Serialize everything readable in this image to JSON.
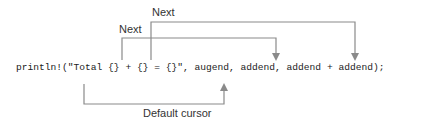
{
  "code_line": "println!(\"Total {} + {} = {}\", augend, addend, addend + addend);",
  "labels": {
    "next_outer": "Next",
    "next_inner": "Next",
    "default_cursor": "Default cursor"
  },
  "colors": {
    "line": "#8a8a8a",
    "text": "#222222"
  }
}
